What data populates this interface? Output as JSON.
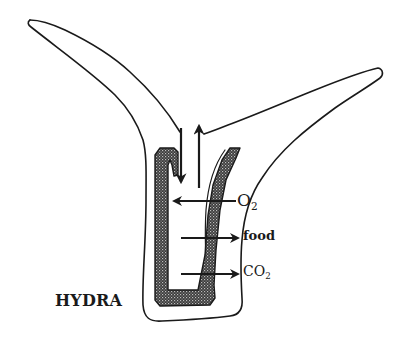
{
  "diagram": {
    "title_label": "HYDRA",
    "labels": {
      "oxygen": {
        "main": "O",
        "sub": "2"
      },
      "food": "food",
      "carbon_dioxide": {
        "main": "CO",
        "sub": "2"
      }
    },
    "colors": {
      "outline": "#1a1a1a",
      "background": "#ffffff",
      "gut_fill": "#2e2e2e"
    }
  }
}
